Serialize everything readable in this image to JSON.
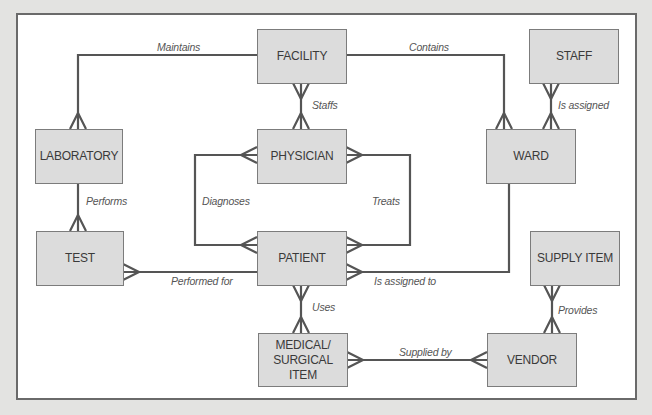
{
  "diagram": {
    "type": "entity-relationship",
    "entities": [
      {
        "id": "facility",
        "label": "FACILITY"
      },
      {
        "id": "physician",
        "label": "PHYSICIAN"
      },
      {
        "id": "patient",
        "label": "PATIENT"
      },
      {
        "id": "medical_surgical_item",
        "label": "MEDICAL/\nSURGICAL\nITEM"
      },
      {
        "id": "laboratory",
        "label": "LABORATORY"
      },
      {
        "id": "test",
        "label": "TEST"
      },
      {
        "id": "staff",
        "label": "STAFF"
      },
      {
        "id": "ward",
        "label": "WARD"
      },
      {
        "id": "supply_item",
        "label": "SUPPLY ITEM"
      },
      {
        "id": "vendor",
        "label": "VENDOR"
      }
    ],
    "relationships": [
      {
        "label": "Maintains",
        "from": "FACILITY",
        "to": "LABORATORY",
        "many_end": [
          "LABORATORY"
        ]
      },
      {
        "label": "Contains",
        "from": "FACILITY",
        "to": "WARD",
        "many_end": [
          "WARD"
        ]
      },
      {
        "label": "Staffs",
        "from": "FACILITY",
        "to": "PHYSICIAN",
        "many_end": [
          "FACILITY",
          "PHYSICIAN"
        ]
      },
      {
        "label": "Is assigned",
        "from": "STAFF",
        "to": "WARD",
        "many_end": [
          "STAFF",
          "WARD"
        ]
      },
      {
        "label": "Performs",
        "from": "LABORATORY",
        "to": "TEST",
        "many_end": [
          "TEST"
        ]
      },
      {
        "label": "Diagnoses",
        "from": "PHYSICIAN",
        "to": "PATIENT",
        "many_end": [
          "PHYSICIAN",
          "PATIENT"
        ]
      },
      {
        "label": "Treats",
        "from": "PHYSICIAN",
        "to": "PATIENT",
        "many_end": [
          "PHYSICIAN",
          "PATIENT"
        ]
      },
      {
        "label": "Performed for",
        "from": "TEST",
        "to": "PATIENT",
        "many_end": [
          "TEST"
        ]
      },
      {
        "label": "Is assigned to",
        "from": "PATIENT",
        "to": "WARD",
        "many_end": [
          "PATIENT"
        ]
      },
      {
        "label": "Uses",
        "from": "PATIENT",
        "to": "MEDICAL/SURGICAL ITEM",
        "many_end": [
          "PATIENT",
          "MEDICAL/SURGICAL ITEM"
        ]
      },
      {
        "label": "Supplied by",
        "from": "MEDICAL/SURGICAL ITEM",
        "to": "VENDOR",
        "many_end": [
          "MEDICAL/SURGICAL ITEM",
          "VENDOR"
        ]
      },
      {
        "label": "Provides",
        "from": "SUPPLY ITEM",
        "to": "VENDOR",
        "many_end": [
          "SUPPLY ITEM",
          "VENDOR"
        ]
      }
    ]
  },
  "labels": {
    "facility": "FACILITY",
    "physician": "PHYSICIAN",
    "patient": "PATIENT",
    "medical_surgical_item": "MEDICAL/\nSURGICAL\nITEM",
    "laboratory": "LABORATORY",
    "test": "TEST",
    "staff": "STAFF",
    "ward": "WARD",
    "supply_item": "SUPPLY ITEM",
    "vendor": "VENDOR",
    "rel_maintains": "Maintains",
    "rel_contains": "Contains",
    "rel_staffs": "Staffs",
    "rel_is_assigned": "Is assigned",
    "rel_performs": "Performs",
    "rel_diagnoses": "Diagnoses",
    "rel_treats": "Treats",
    "rel_performed_for": "Performed for",
    "rel_is_assigned_to": "Is assigned to",
    "rel_uses": "Uses",
    "rel_supplied_by": "Supplied by",
    "rel_provides": "Provides"
  },
  "colors": {
    "background": "#e3e3e1",
    "canvas": "#ffffff",
    "entity_fill": "#dcdcdc",
    "entity_border": "#7c7c7c",
    "line": "#555555",
    "text": "#3a3a3a"
  }
}
